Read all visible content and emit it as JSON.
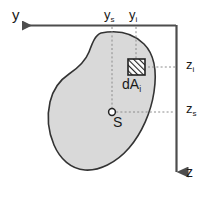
{
  "figure": {
    "background_color": "#ffffff",
    "shape_fill_color": "#d9d9d9",
    "shape_stroke_color": "#333333",
    "axis_color": "#4d4d4d",
    "dotted_color": "#808080",
    "text_color": "#1a1a1a"
  },
  "axes": {
    "horizontal": {
      "name": "y",
      "label": "y",
      "direction": "left",
      "arrow": "left-arrow"
    },
    "vertical": {
      "name": "z",
      "label": "z",
      "direction": "down",
      "arrow": "down-arrow"
    }
  },
  "labels": {
    "y_s": {
      "base": "y",
      "sub": "s"
    },
    "y_i": {
      "base": "y",
      "sub": "i"
    },
    "z_i": {
      "base": "z",
      "sub": "i"
    },
    "z_s": {
      "base": "z",
      "sub": "s"
    },
    "dA_i": {
      "base": "dA",
      "sub": "i"
    },
    "centroid": "S"
  },
  "elements": {
    "area_element": {
      "name": "dA_i",
      "fill_pattern": "diagonal-hatch",
      "shape": "square"
    },
    "centroid_marker": {
      "name": "S",
      "shape": "open-circle"
    },
    "cross_section": {
      "name": "blob-cross-section",
      "fill": "#d9d9d9"
    }
  }
}
